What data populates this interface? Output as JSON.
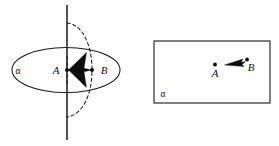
{
  "figure": {
    "background_color": "#ffffff",
    "ink_color": "#1a1a1a",
    "panels": [
      {
        "id": "perspective-panel",
        "kind": "3d-perspective-view",
        "description": "Plane alpha drawn as an ellipse in perspective, pierced by a vertical axis line through point A, with vector from A to B and a dashed circle of rotation through B.",
        "plane_label": "α",
        "points": [
          {
            "name": "A",
            "label": "A",
            "x": 67,
            "y": 70
          },
          {
            "name": "B",
            "label": "B",
            "x": 92,
            "y": 70
          }
        ],
        "vector": {
          "from": "A",
          "to": "B",
          "direction": "rightward"
        },
        "ellipse": {
          "cx": 66,
          "cy": 70,
          "rx": 54,
          "ry": 22.5
        },
        "axis_line": {
          "x": 67,
          "y_top": 5,
          "y_bottom": 140
        },
        "dashed_circle": {
          "cx": 67,
          "cy": 70,
          "rx": 26,
          "ry": 48
        }
      },
      {
        "id": "plan-panel",
        "kind": "2d-plan-view",
        "description": "Plane alpha drawn as a rectangle containing points A and B with a vector pointing from B toward A.",
        "plane_label": "α",
        "points": [
          {
            "name": "A",
            "label": "A",
            "x": 215,
            "y": 69
          },
          {
            "name": "B",
            "label": "B",
            "x": 247,
            "y": 64
          }
        ],
        "vector": {
          "from": "B",
          "to": "A",
          "direction": "leftward"
        },
        "rect": {
          "x": 154,
          "y": 41,
          "width": 116,
          "height": 62
        }
      }
    ],
    "labels": {
      "alpha": "α",
      "point_a": "A",
      "point_b": "B"
    }
  }
}
